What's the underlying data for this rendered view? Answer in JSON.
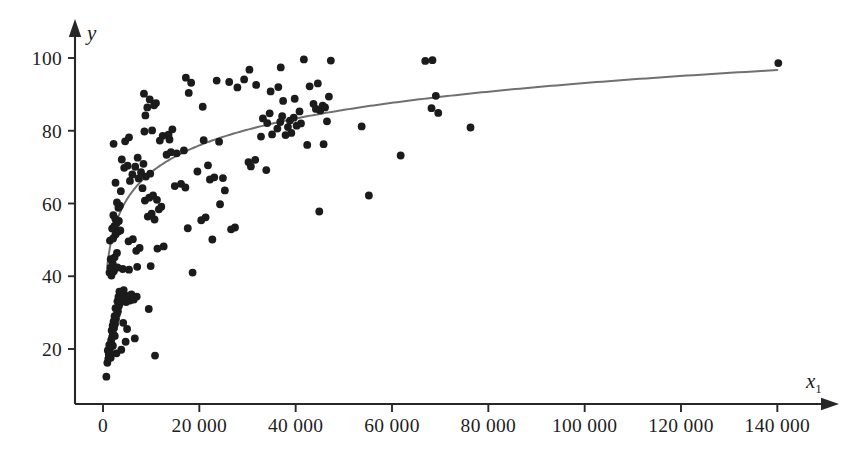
{
  "figure": {
    "background": "#ffffff",
    "point_color": "#1b1b1c",
    "curve_color": "#6f7073",
    "axis_color": "#272727"
  },
  "axes": {
    "y_label": "y",
    "x_label_base": "x",
    "x_label_sub": "1",
    "x_ticks": [
      "0",
      "20 000",
      "40 000",
      "60 000",
      "80 000",
      "100 000",
      "120 000",
      "140 000"
    ],
    "x_tick_values": [
      0,
      20000,
      40000,
      60000,
      80000,
      100000,
      120000,
      140000
    ],
    "y_ticks": [
      "20",
      "40",
      "60",
      "80",
      "100"
    ],
    "y_tick_values": [
      20,
      40,
      60,
      80,
      100
    ]
  },
  "chart_data": {
    "type": "scatter",
    "title": "",
    "xlabel": "x₁",
    "ylabel": "y",
    "xlim": [
      -4000,
      148000
    ],
    "ylim": [
      8,
      108
    ],
    "grid": false,
    "legend": "none",
    "series": [
      {
        "name": "observations",
        "type": "scatter",
        "marker": "filled-circle",
        "color": "#1b1b1c",
        "marker_size_px": 5.6,
        "points": [
          [
            700,
            12.4
          ],
          [
            900,
            16.2
          ],
          [
            1100,
            17.3
          ],
          [
            1200,
            18.4
          ],
          [
            1000,
            19.6
          ],
          [
            1400,
            19.0
          ],
          [
            1500,
            20.3
          ],
          [
            1300,
            21.1
          ],
          [
            1700,
            22.4
          ],
          [
            1900,
            23.3
          ],
          [
            2100,
            24.2
          ],
          [
            1800,
            25.1
          ],
          [
            2300,
            25.8
          ],
          [
            2000,
            26.4
          ],
          [
            2500,
            26.9
          ],
          [
            2200,
            27.6
          ],
          [
            2700,
            28.3
          ],
          [
            2400,
            29.0
          ],
          [
            2900,
            29.6
          ],
          [
            3100,
            30.4
          ],
          [
            2600,
            31.2
          ],
          [
            3300,
            31.8
          ],
          [
            3500,
            32.6
          ],
          [
            3000,
            33.1
          ],
          [
            3700,
            33.7
          ],
          [
            3200,
            34.3
          ],
          [
            3900,
            34.8
          ],
          [
            4100,
            35.3
          ],
          [
            3400,
            35.8
          ],
          [
            4300,
            36.2
          ],
          [
            3600,
            33.4
          ],
          [
            4500,
            34.0
          ],
          [
            5200,
            34.6
          ],
          [
            4800,
            32.9
          ],
          [
            5600,
            33.3
          ],
          [
            6100,
            34.1
          ],
          [
            5900,
            35.0
          ],
          [
            6400,
            33.6
          ],
          [
            7000,
            34.4
          ],
          [
            9500,
            31.0
          ],
          [
            10800,
            18.2
          ],
          [
            4700,
            22.0
          ],
          [
            6600,
            22.9
          ],
          [
            3800,
            19.8
          ],
          [
            2800,
            18.8
          ],
          [
            1600,
            17.6
          ],
          [
            2050,
            20.9
          ],
          [
            2450,
            23.6
          ],
          [
            5000,
            25.5
          ],
          [
            4200,
            27.2
          ],
          [
            1350,
            41.0
          ],
          [
            1500,
            42.3
          ],
          [
            1750,
            40.2
          ],
          [
            2000,
            43.6
          ],
          [
            2250,
            41.4
          ],
          [
            3000,
            42.4
          ],
          [
            4100,
            42.0
          ],
          [
            5400,
            41.8
          ],
          [
            7100,
            42.6
          ],
          [
            18600,
            41.0
          ],
          [
            9900,
            42.8
          ],
          [
            1600,
            44.7
          ],
          [
            2400,
            45.2
          ],
          [
            2900,
            46.4
          ],
          [
            6900,
            47.0
          ],
          [
            7600,
            47.8
          ],
          [
            11300,
            47.6
          ],
          [
            12600,
            48.2
          ],
          [
            1450,
            49.8
          ],
          [
            2100,
            50.4
          ],
          [
            5300,
            49.6
          ],
          [
            6200,
            50.2
          ],
          [
            22700,
            50.1
          ],
          [
            2600,
            51.5
          ],
          [
            3100,
            52.2
          ],
          [
            1900,
            53.1
          ],
          [
            2350,
            53.8
          ],
          [
            3600,
            52.6
          ],
          [
            17600,
            53.2
          ],
          [
            26600,
            52.9
          ],
          [
            27400,
            53.4
          ],
          [
            2800,
            54.6
          ],
          [
            3300,
            55.2
          ],
          [
            20400,
            55.4
          ],
          [
            21300,
            56.2
          ],
          [
            2150,
            56.8
          ],
          [
            2550,
            55.8
          ],
          [
            9300,
            56.4
          ],
          [
            10100,
            57.2
          ],
          [
            10700,
            55.6
          ],
          [
            44900,
            57.8
          ],
          [
            11600,
            58.4
          ],
          [
            3200,
            58.8
          ],
          [
            3500,
            59.4
          ],
          [
            12100,
            59.1
          ],
          [
            24300,
            59.8
          ],
          [
            2900,
            60.3
          ],
          [
            8700,
            60.8
          ],
          [
            9600,
            61.6
          ],
          [
            10400,
            62.2
          ],
          [
            11200,
            61.0
          ],
          [
            55200,
            62.2
          ],
          [
            3700,
            63.4
          ],
          [
            8200,
            64.2
          ],
          [
            25300,
            63.6
          ],
          [
            14900,
            64.8
          ],
          [
            16200,
            65.4
          ],
          [
            17100,
            64.4
          ],
          [
            2600,
            65.7
          ],
          [
            5600,
            66.2
          ],
          [
            7400,
            66.9
          ],
          [
            8900,
            67.4
          ],
          [
            22200,
            66.6
          ],
          [
            23100,
            67.2
          ],
          [
            24900,
            67.0
          ],
          [
            6100,
            68.0
          ],
          [
            7900,
            68.6
          ],
          [
            9800,
            68.2
          ],
          [
            19600,
            68.8
          ],
          [
            33900,
            69.2
          ],
          [
            4400,
            69.8
          ],
          [
            5100,
            70.4
          ],
          [
            6700,
            70.1
          ],
          [
            8400,
            70.9
          ],
          [
            21800,
            70.5
          ],
          [
            30700,
            70.2
          ],
          [
            30200,
            71.4
          ],
          [
            3900,
            72.1
          ],
          [
            7200,
            72.6
          ],
          [
            31600,
            72.0
          ],
          [
            61800,
            73.2
          ],
          [
            13200,
            73.4
          ],
          [
            14100,
            74.1
          ],
          [
            15300,
            73.8
          ],
          [
            16800,
            74.6
          ],
          [
            42400,
            76.1
          ],
          [
            45800,
            76.3
          ],
          [
            2200,
            76.4
          ],
          [
            4600,
            77.1
          ],
          [
            11800,
            77.3
          ],
          [
            13800,
            77.6
          ],
          [
            20900,
            77.4
          ],
          [
            24100,
            77.0
          ],
          [
            5400,
            78.2
          ],
          [
            12400,
            78.6
          ],
          [
            13600,
            78.9
          ],
          [
            32800,
            78.4
          ],
          [
            35100,
            79.0
          ],
          [
            37900,
            78.8
          ],
          [
            39100,
            79.4
          ],
          [
            8600,
            79.8
          ],
          [
            10200,
            80.1
          ],
          [
            14400,
            80.4
          ],
          [
            36200,
            80.6
          ],
          [
            38400,
            81.0
          ],
          [
            40200,
            81.4
          ],
          [
            53700,
            81.2
          ],
          [
            76300,
            80.9
          ],
          [
            34100,
            82.1
          ],
          [
            36800,
            82.4
          ],
          [
            38800,
            82.8
          ],
          [
            41100,
            82.0
          ],
          [
            46500,
            82.6
          ],
          [
            33200,
            83.4
          ],
          [
            37200,
            84.0
          ],
          [
            39600,
            83.6
          ],
          [
            69600,
            84.9
          ],
          [
            8800,
            84.2
          ],
          [
            34600,
            84.8
          ],
          [
            40800,
            85.3
          ],
          [
            45100,
            85.6
          ],
          [
            44200,
            86.0
          ],
          [
            46100,
            86.4
          ],
          [
            45600,
            86.9
          ],
          [
            68200,
            86.2
          ],
          [
            9200,
            86.4
          ],
          [
            10600,
            87.0
          ],
          [
            11000,
            87.6
          ],
          [
            20700,
            86.6
          ],
          [
            43700,
            87.4
          ],
          [
            37400,
            88.2
          ],
          [
            9700,
            88.6
          ],
          [
            39800,
            88.8
          ],
          [
            46900,
            89.4
          ],
          [
            69100,
            89.6
          ],
          [
            8500,
            90.2
          ],
          [
            17800,
            90.4
          ],
          [
            34800,
            90.8
          ],
          [
            27900,
            91.9
          ],
          [
            42900,
            92.2
          ],
          [
            31800,
            92.6
          ],
          [
            36400,
            92.0
          ],
          [
            18300,
            93.2
          ],
          [
            23600,
            93.8
          ],
          [
            26200,
            93.4
          ],
          [
            29300,
            94.1
          ],
          [
            44600,
            93.0
          ],
          [
            17200,
            94.6
          ],
          [
            30400,
            96.8
          ],
          [
            36900,
            97.4
          ],
          [
            140200,
            98.6
          ],
          [
            66900,
            99.2
          ],
          [
            68400,
            99.4
          ],
          [
            41700,
            99.6
          ],
          [
            47300,
            99.3
          ]
        ]
      },
      {
        "name": "fitted-log-curve",
        "type": "line",
        "color": "#6f7073",
        "equation": "y = a + b*ln(x)",
        "fit_a": -29.5,
        "fit_b": 10.65,
        "endpoints_xy": [
          [
            900,
            14.8
          ],
          [
            140000,
            96.0
          ]
        ]
      }
    ]
  }
}
